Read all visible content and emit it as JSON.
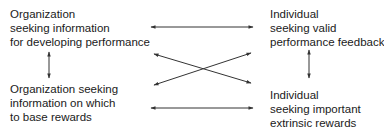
{
  "diagram": {
    "nodes": {
      "top_left": {
        "lines": [
          "Organization",
          "seeking information",
          "for developing performance"
        ]
      },
      "top_right": {
        "lines": [
          "Individual",
          "seeking valid",
          "performance feedback"
        ]
      },
      "bottom_left": {
        "lines": [
          "Organization seeking",
          "information on which",
          "to base rewards"
        ]
      },
      "bottom_right": {
        "lines": [
          "Individual",
          "seeking important",
          "extrinsic rewards"
        ]
      }
    },
    "edges": [
      {
        "from": "top_left",
        "to": "top_right",
        "type": "bidirectional"
      },
      {
        "from": "bottom_left",
        "to": "bottom_right",
        "type": "bidirectional"
      },
      {
        "from": "top_left",
        "to": "bottom_right",
        "type": "bidirectional"
      },
      {
        "from": "bottom_left",
        "to": "top_right",
        "type": "bidirectional"
      },
      {
        "from": "top_left",
        "to": "bottom_left",
        "type": "bidirectional"
      },
      {
        "from": "top_right",
        "to": "bottom_right",
        "type": "bidirectional"
      }
    ],
    "colors": {
      "line": "#333333",
      "text": "#1a1a1a"
    }
  }
}
